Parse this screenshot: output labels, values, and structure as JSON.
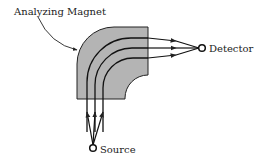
{
  "diagram": {
    "labels": {
      "magnet": "Analyzing Magnet",
      "detector": "Detector",
      "source": "Source"
    },
    "colors": {
      "magnet_fill": "#b4b4b4",
      "stroke": "#222222",
      "background": "#ffffff"
    },
    "beam_count": 3
  }
}
